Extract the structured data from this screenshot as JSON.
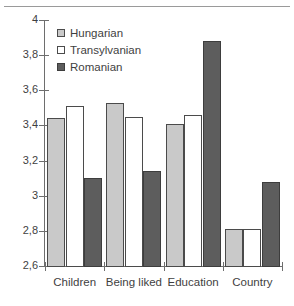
{
  "chart_data": {
    "type": "bar",
    "title": "",
    "subtitle": "",
    "xlabel": "",
    "ylabel": "",
    "categories": [
      "Children",
      "Being liked",
      "Education",
      "Country"
    ],
    "series": [
      {
        "name": "Hungarian",
        "color": "#c9c9c9",
        "values": [
          3.44,
          3.53,
          3.41,
          2.81
        ]
      },
      {
        "name": "Transylvanian",
        "color": "#ffffff",
        "values": [
          3.51,
          3.45,
          3.46,
          2.81
        ]
      },
      {
        "name": "Romanian",
        "color": "#5d5d5d",
        "values": [
          3.1,
          3.14,
          3.88,
          3.08
        ]
      }
    ],
    "ylim": [
      2.6,
      4.0
    ],
    "ytick_values": [
      4,
      3.8,
      3.6,
      3.4,
      3.2,
      3,
      2.8,
      2.6
    ],
    "ytick_labels": [
      "4",
      "3,8",
      "3,6",
      "3,4",
      "3,2",
      "3",
      "2,8",
      "2,6"
    ],
    "grid": false,
    "legend_position": "top-left",
    "decimal_separator": ","
  },
  "legend": {
    "items": [
      {
        "label": "Hungarian",
        "swatch": "light-gray-square"
      },
      {
        "label": "Transylvanian",
        "swatch": "white-square"
      },
      {
        "label": "Romanian",
        "swatch": "dark-gray-square"
      }
    ]
  },
  "caption_strip": ""
}
